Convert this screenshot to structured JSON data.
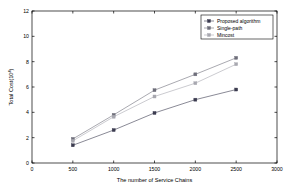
{
  "chart_data": {
    "type": "line",
    "title": "",
    "xlabel": "The number of Service Chains",
    "ylabel": "Total Cost(10^4)",
    "ylabel_base": "Total Cost(10",
    "ylabel_sup": "4",
    "ylabel_tail": ")",
    "xlim": [
      0,
      3000
    ],
    "ylim": [
      0,
      12
    ],
    "xticks": [
      0,
      500,
      1000,
      1500,
      2000,
      2500,
      3000
    ],
    "xtick_labels": [
      "0",
      "500",
      "1000",
      "1500",
      "2000",
      "2500",
      "3000"
    ],
    "yticks": [
      0,
      2,
      4,
      6,
      8,
      10,
      12
    ],
    "ytick_labels": [
      "0",
      "2",
      "4",
      "6",
      "8",
      "10",
      "12"
    ],
    "grid": false,
    "legend_position": "top-right",
    "x": [
      500,
      1000,
      1500,
      2000,
      2500
    ],
    "series": [
      {
        "name": "Proposed algorithm",
        "values": [
          1.4,
          2.6,
          3.95,
          5.0,
          5.8
        ],
        "color": "#3b3b4f",
        "marker": "square"
      },
      {
        "name": "Single-path",
        "values": [
          1.9,
          3.8,
          5.75,
          7.0,
          8.3
        ],
        "color": "#6e6e7a",
        "marker": "square"
      },
      {
        "name": "Mincost",
        "values": [
          1.75,
          3.65,
          5.25,
          6.3,
          7.8
        ],
        "color": "#a8a8b0",
        "marker": "square"
      }
    ]
  },
  "legend": {
    "entries": [
      "Proposed algorithm",
      "Single-path",
      "Mincost"
    ]
  }
}
